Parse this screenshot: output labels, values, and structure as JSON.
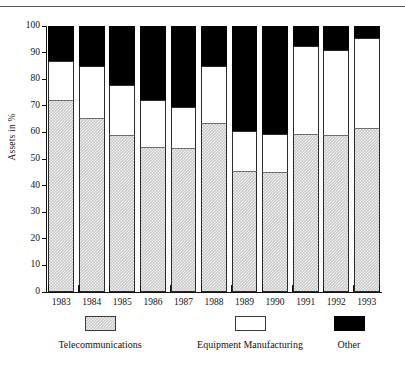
{
  "figure": {
    "ylabel": "Assets in %",
    "has_top_rule": true
  },
  "chart_data": {
    "type": "bar",
    "stacked": true,
    "title": "",
    "xlabel": "",
    "ylabel": "Assets in %",
    "ylim": [
      0,
      100
    ],
    "yticks": [
      0,
      10,
      20,
      30,
      40,
      50,
      60,
      70,
      80,
      90,
      100
    ],
    "grid": false,
    "legend_position": "bottom",
    "categories": [
      "1983",
      "1984",
      "1985",
      "1986",
      "1987",
      "1988",
      "1989",
      "1990",
      "1991",
      "1992",
      "1993"
    ],
    "series": [
      {
        "name": "Telecommunications",
        "color": "#c9c9c9",
        "pattern": "checker-dither",
        "values": [
          72,
          65.5,
          59,
          54.5,
          54,
          63.5,
          45.5,
          45,
          59.5,
          59,
          61.5
        ]
      },
      {
        "name": "Equipment Manufacturing",
        "color": "#ffffff",
        "pattern": "solid",
        "values": [
          15,
          19.5,
          19,
          17.5,
          15.5,
          21.5,
          15,
          14.5,
          33,
          32,
          34
        ]
      },
      {
        "name": "Other",
        "color": "#000000",
        "pattern": "solid",
        "values": [
          13,
          15,
          22,
          28,
          30.5,
          15,
          39.5,
          40.5,
          7.5,
          9,
          4.5
        ]
      }
    ],
    "cumulative_tops": {
      "telecommunications": [
        72,
        65.5,
        59,
        54.5,
        54,
        63.5,
        45.5,
        45,
        59.5,
        59,
        61.5
      ],
      "equipment_manufacturing": [
        87,
        85,
        78,
        72,
        69.5,
        85,
        60.5,
        59.5,
        92.5,
        91,
        95.5
      ],
      "other": [
        100,
        100,
        100,
        100,
        100,
        100,
        100,
        100,
        100,
        100,
        100
      ]
    }
  },
  "legend": {
    "items": [
      {
        "label": "Telecommunications",
        "swatch": "telecom-swatch"
      },
      {
        "label": "Equipment Manufacturing",
        "swatch": "equipment-swatch"
      },
      {
        "label": "Other",
        "swatch": "other-swatch"
      }
    ]
  }
}
